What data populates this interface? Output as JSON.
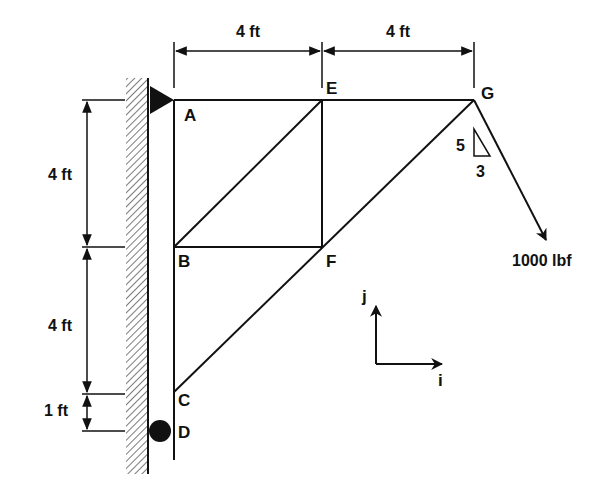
{
  "diagram": {
    "type": "truss",
    "colors": {
      "ink": "#111111",
      "background": "#ffffff"
    },
    "nodes": {
      "A": {
        "label": "A"
      },
      "B": {
        "label": "B"
      },
      "C": {
        "label": "C"
      },
      "D": {
        "label": "D"
      },
      "E": {
        "label": "E"
      },
      "F": {
        "label": "F"
      },
      "G": {
        "label": "G"
      }
    },
    "members": [
      "A-E",
      "E-G",
      "A-B",
      "B-C",
      "C-D",
      "B-E",
      "B-F",
      "E-F",
      "F-G",
      "C-G"
    ],
    "supports": {
      "A": "pin (triangle) on wall",
      "D": "roller (circle) on wall"
    },
    "dimensions": {
      "top_left": "4 ft",
      "top_right": "4 ft",
      "left_upper": "4 ft",
      "left_middle": "4 ft",
      "left_lower": "1 ft"
    },
    "load": {
      "magnitude": "1000 lbf",
      "slope_rise": "5",
      "slope_run": "3"
    },
    "axes": {
      "x_label": "i",
      "y_label": "j"
    }
  }
}
